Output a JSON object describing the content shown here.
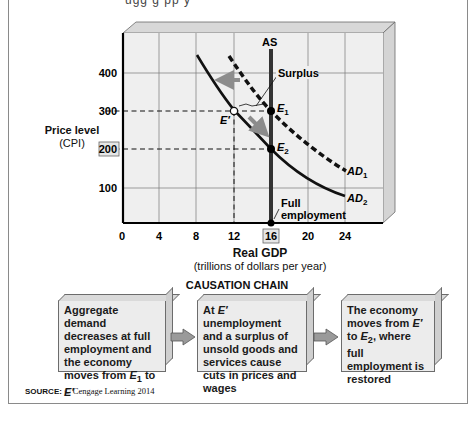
{
  "top_fragment": "ugg g   pp y  ",
  "chart_data": {
    "type": "line",
    "title": "",
    "xlabel": "Real GDP",
    "xlabel_sub": "(trillions of dollars per year)",
    "ylabel": "Price level",
    "ylabel_sub": "(CPI)",
    "xlim": [
      0,
      28
    ],
    "ylim": [
      0,
      500
    ],
    "x_ticks": [
      "0",
      "4",
      "8",
      "12",
      "16",
      "20",
      "24"
    ],
    "y_ticks": [
      "100",
      "200",
      "300",
      "400"
    ],
    "highlighted_ticks": {
      "x": "16",
      "y": "200"
    },
    "grid": true,
    "series": [
      {
        "name": "AS",
        "style": "solid-vertical",
        "x": [
          16,
          16
        ],
        "y": [
          0,
          470
        ]
      },
      {
        "name": "AD1",
        "style": "dashed",
        "x": [
          12,
          14,
          16,
          20,
          24
        ],
        "y": [
          420,
          350,
          300,
          210,
          140
        ]
      },
      {
        "name": "AD2",
        "style": "solid",
        "x": [
          8,
          10,
          12,
          16,
          20,
          24
        ],
        "y": [
          430,
          360,
          300,
          200,
          130,
          75
        ]
      }
    ],
    "points": [
      {
        "label": "E1",
        "x": 16,
        "y": 300,
        "fill": "black"
      },
      {
        "label": "E2",
        "x": 16,
        "y": 200,
        "fill": "black"
      },
      {
        "label": "E'",
        "x": 12,
        "y": 300,
        "fill": "white"
      },
      {
        "label": "",
        "x": 16,
        "y": 0,
        "fill": "black"
      }
    ],
    "annotations": [
      "Surplus",
      "Full employment",
      "AS",
      "AD1",
      "AD2"
    ],
    "reference_lines": [
      {
        "type": "h-dashed",
        "y": 300,
        "x_to": 16
      },
      {
        "type": "h-dashed",
        "y": 200,
        "x_to": 16
      },
      {
        "type": "v-dashed",
        "x": 12,
        "y_from": 0,
        "y_to": 300
      }
    ]
  },
  "labels": {
    "as": "AS",
    "surplus": "Surplus",
    "e1": "E",
    "e1_sub": "1",
    "e2": "E",
    "e2_sub": "2",
    "eprime": "E′",
    "ad1": "AD",
    "ad1_sub": "1",
    "ad2": "AD",
    "ad2_sub": "2",
    "full_emp_1": "Full",
    "full_emp_2": "employment"
  },
  "causation": {
    "title": "CAUSATION CHAIN",
    "boxes": [
      {
        "text_html": "Aggregate demand decreases at full employment and the economy moves from <i>E</i><sub>1</sub> to <i>E′</i>"
      },
      {
        "text_html": "At <i>E′</i> unemployment and a surplus of unsold goods and services cause cuts in prices and wages"
      },
      {
        "text_html": "The economy moves from <i>E′</i> to <i>E</i><sub>2</sub>, where full employment is restored"
      }
    ]
  },
  "source": {
    "label": "SOURCE:",
    "text": "© Cengage Learning 2014"
  }
}
